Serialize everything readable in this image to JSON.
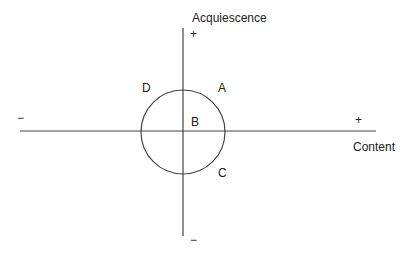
{
  "diagram": {
    "axes": {
      "vertical": {
        "label": "Acquiescence",
        "positive": "+",
        "negative": "−"
      },
      "horizontal": {
        "label": "Content",
        "positive": "+",
        "negative": "−"
      }
    },
    "regions": [
      "A",
      "B",
      "C",
      "D"
    ],
    "colors": {
      "line": "#333333",
      "background": "#ffffff"
    }
  }
}
